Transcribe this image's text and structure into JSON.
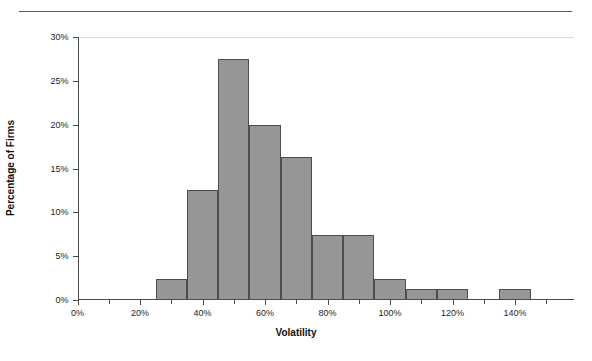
{
  "chart_data": {
    "type": "bar",
    "title": "",
    "subtitle": "",
    "xlabel": "Volatility",
    "ylabel": "Percentage of Firms",
    "xlim": [
      -5,
      155
    ],
    "ylim": [
      0,
      30
    ],
    "grid": false,
    "legend": null,
    "bin_width": 10,
    "x_unit": "%",
    "y_unit": "%",
    "x_tick_labels": [
      "0%",
      "20%",
      "40%",
      "60%",
      "80%",
      "100%",
      "120%",
      "140%"
    ],
    "x_tick_values": [
      0,
      20,
      40,
      60,
      80,
      100,
      120,
      140
    ],
    "x_minor_tick_values": [
      10,
      30,
      50,
      70,
      90,
      110,
      130,
      150
    ],
    "y_tick_labels": [
      "0%",
      "5%",
      "10%",
      "15%",
      "20%",
      "25%",
      "30%"
    ],
    "y_tick_values": [
      0,
      5,
      10,
      15,
      20,
      25,
      30
    ],
    "bins": [
      {
        "start": 25,
        "end": 35,
        "center": 30,
        "value": 2.4,
        "label": "2.4%"
      },
      {
        "start": 35,
        "end": 45,
        "center": 40,
        "value": 12.5,
        "label": "12.5%"
      },
      {
        "start": 45,
        "end": 55,
        "center": 50,
        "value": 27.5,
        "label": "27.5%"
      },
      {
        "start": 55,
        "end": 65,
        "center": 60,
        "value": 20.0,
        "label": "20.0%"
      },
      {
        "start": 65,
        "end": 75,
        "center": 70,
        "value": 16.3,
        "label": "16.3%"
      },
      {
        "start": 75,
        "end": 85,
        "center": 80,
        "value": 7.4,
        "label": "7.4%"
      },
      {
        "start": 85,
        "end": 95,
        "center": 90,
        "value": 7.4,
        "label": "7.4%"
      },
      {
        "start": 95,
        "end": 105,
        "center": 100,
        "value": 2.4,
        "label": "2.4%"
      },
      {
        "start": 105,
        "end": 115,
        "center": 110,
        "value": 1.2,
        "label": "1.2%"
      },
      {
        "start": 115,
        "end": 125,
        "center": 120,
        "value": 1.2,
        "label": "1.2%"
      },
      {
        "start": 135,
        "end": 145,
        "center": 140,
        "value": 1.2,
        "label": "1.2%"
      }
    ],
    "categories": [
      "30%",
      "40%",
      "50%",
      "60%",
      "70%",
      "80%",
      "90%",
      "100%",
      "110%",
      "120%",
      "140%"
    ],
    "values": [
      2.4,
      12.5,
      27.5,
      20.0,
      16.3,
      7.4,
      7.4,
      2.4,
      1.2,
      1.2,
      1.2
    ],
    "colors": {
      "bar_fill": "#969696",
      "bar_border": "#4d4d4d",
      "axis": "#4a4a4a",
      "gridline": "#d9d9d9",
      "text": "#262626",
      "rule": "#5a5a5a",
      "background": "#ffffff"
    }
  }
}
